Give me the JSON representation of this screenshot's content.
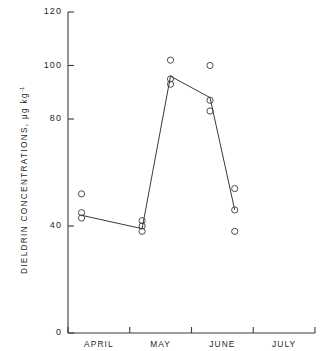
{
  "chart_data": {
    "type": "scatter",
    "title": "",
    "xlabel": "",
    "ylabel": "DIELDRIN CONCENTRATIONS,  μg kg",
    "ylabel_exponent": "-1",
    "ylim": [
      0,
      120
    ],
    "yticks": [
      0,
      40,
      80,
      100,
      120
    ],
    "ytick_labels": [
      "0",
      "40",
      "80",
      "100",
      "120"
    ],
    "grid": false,
    "legend": null,
    "xtick_labels": [
      "APRIL",
      "MAY",
      "JUNE",
      "JULY"
    ],
    "x_category_positions": [
      0.5,
      1.5,
      2.5,
      3.5
    ],
    "x_boundary_ticks": [
      0,
      1,
      2,
      3,
      4
    ],
    "sampling_points": [
      {
        "label": "APRIL",
        "x": 0.22,
        "mean": 44,
        "replicates": [
          52,
          45,
          43
        ]
      },
      {
        "label": "MAY",
        "x": 1.2,
        "mean": 39,
        "replicates": [
          42,
          40,
          38
        ]
      },
      {
        "label": "JUNE-1",
        "x": 1.66,
        "mean": 96,
        "replicates": [
          102,
          95,
          93
        ]
      },
      {
        "label": "JUNE-2",
        "x": 2.3,
        "mean": 88,
        "replicates": [
          100,
          87,
          83
        ]
      },
      {
        "label": "JULY",
        "x": 2.7,
        "mean": 46,
        "replicates": [
          54,
          46,
          38
        ]
      }
    ],
    "line_series": {
      "name": "mean dieldrin concentration",
      "x": [
        0.22,
        1.2,
        1.66,
        2.3,
        2.7
      ],
      "values": [
        44,
        39,
        96,
        88,
        46
      ]
    }
  }
}
